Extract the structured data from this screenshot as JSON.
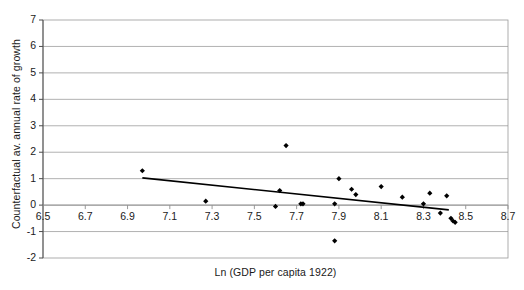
{
  "chart_data": {
    "type": "scatter",
    "title": "",
    "xlabel": "Ln (GDP per capita 1922)",
    "ylabel": "Counterfactual av. annual rate of growth",
    "xlim": [
      6.5,
      8.7
    ],
    "ylim": [
      -2,
      7
    ],
    "xticks": [
      "6.5",
      "6.7",
      "6.9",
      "7.1",
      "7.3",
      "7.5",
      "7.7",
      "7.9",
      "8.1",
      "8.3",
      "8.5",
      "8.7"
    ],
    "xtick_values": [
      6.5,
      6.7,
      6.9,
      7.1,
      7.3,
      7.5,
      7.7,
      7.9,
      8.1,
      8.3,
      8.5,
      8.7
    ],
    "yticks": [
      "7",
      "6",
      "5",
      "4",
      "3",
      "2",
      "1",
      "0",
      "-1",
      "-2"
    ],
    "ytick_values": [
      7,
      6,
      5,
      4,
      3,
      2,
      1,
      0,
      -1,
      -2
    ],
    "grid": "horizontal",
    "legend": "none",
    "marker": "diamond-filled",
    "marker_color": "#000000",
    "series": [
      {
        "name": "Counterfactual growth vs log GDP per capita 1922",
        "points": [
          [
            6.97,
            1.3
          ],
          [
            7.27,
            0.15
          ],
          [
            7.6,
            -0.05
          ],
          [
            7.62,
            0.55
          ],
          [
            7.65,
            2.25
          ],
          [
            7.72,
            0.05
          ],
          [
            7.73,
            0.05
          ],
          [
            7.88,
            0.05
          ],
          [
            7.88,
            -1.35
          ],
          [
            7.9,
            1.0
          ],
          [
            7.96,
            0.6
          ],
          [
            7.98,
            0.4
          ],
          [
            8.1,
            0.7
          ],
          [
            8.2,
            0.3
          ],
          [
            8.3,
            0.05
          ],
          [
            8.33,
            0.45
          ],
          [
            8.38,
            -0.3
          ],
          [
            8.41,
            0.35
          ],
          [
            8.43,
            -0.5
          ],
          [
            8.44,
            -0.6
          ],
          [
            8.45,
            -0.65
          ]
        ]
      }
    ],
    "trendline": {
      "type": "linear",
      "x_start": 6.97,
      "y_start": 1.03,
      "x_end": 8.42,
      "y_end": -0.18,
      "color": "#000000"
    }
  }
}
